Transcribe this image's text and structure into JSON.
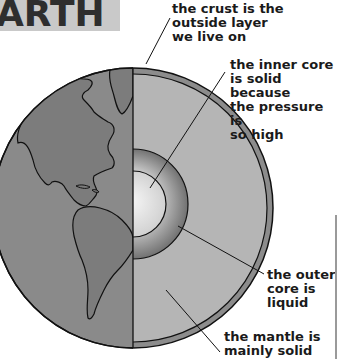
{
  "title": {
    "text": "ARTH"
  },
  "diagram": {
    "colors": {
      "ocean": "#8a8a8a",
      "land": "#7c7c7c",
      "crust": "#8c8c8c",
      "mantle": "#b5b5b5",
      "outer_core_edge": "#707070",
      "inner_core_center": "#f2f2f2",
      "outline": "#111111"
    },
    "labels": {
      "crust": "the crust is the\noutside layer\nwe live on",
      "inner_core": "the inner core\nis solid because\nthe pressure is\nso high",
      "outer_core": "the outer\ncore is\nliquid",
      "mantle": "the mantle is\nmainly solid"
    }
  }
}
